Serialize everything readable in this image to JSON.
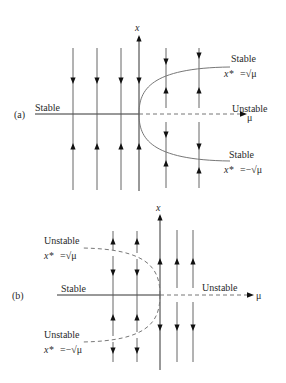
{
  "panel_a": {
    "tag": "(a)",
    "x_axis_label": "x",
    "mu_axis_label": "μ",
    "left_branch_label": "Stable",
    "right_axis_label": "Unstable",
    "upper_branch": {
      "stability": "Stable",
      "equation_lhs": "x*",
      "equation_rhs": "=√μ"
    },
    "lower_branch": {
      "stability": "Stable",
      "equation_lhs": "x*",
      "equation_rhs": "=−√μ"
    }
  },
  "panel_b": {
    "tag": "(b)",
    "x_axis_label": "x",
    "mu_axis_label": "μ",
    "left_branch_label": "Stable",
    "right_axis_label": "Unstable",
    "upper_branch": {
      "stability": "Unstable",
      "equation_lhs": "x*",
      "equation_rhs": "=√μ"
    },
    "lower_branch": {
      "stability": "Unstable",
      "equation_lhs": "x*",
      "equation_rhs": "=−√μ"
    }
  },
  "colors": {
    "axis": "#333333",
    "curve": "#777777",
    "arrow": "#111111"
  }
}
